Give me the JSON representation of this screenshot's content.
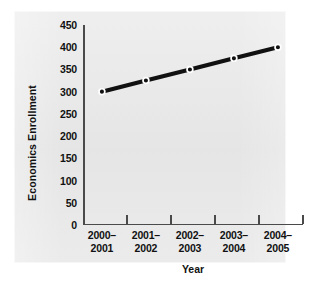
{
  "chart_data": {
    "type": "line",
    "title": "",
    "xlabel": "Year",
    "ylabel": "Economics Enrollment",
    "categories": [
      "2000–2001",
      "2001–2002",
      "2002–2003",
      "2003–2004",
      "2004–2005"
    ],
    "category_lines": [
      [
        "2000–",
        "2001"
      ],
      [
        "2001–",
        "2002"
      ],
      [
        "2002–",
        "2003"
      ],
      [
        "2003–",
        "2004"
      ],
      [
        "2004–",
        "2005"
      ]
    ],
    "values": [
      300,
      325,
      350,
      375,
      400
    ],
    "series": [
      {
        "name": "Economics Enrollment",
        "values": [
          300,
          325,
          350,
          375,
          400
        ]
      }
    ],
    "ylim": [
      0,
      450
    ],
    "ytick_values": [
      0,
      50,
      100,
      150,
      200,
      250,
      300,
      350,
      400,
      450
    ],
    "ytick_labels": [
      "0",
      "50",
      "100",
      "150",
      "200",
      "250",
      "300",
      "350",
      "400",
      "450"
    ],
    "grid": false,
    "legend": false,
    "legend_position": "none",
    "marker": "circle",
    "line_color": "#111111",
    "marker_face_color": "#ffffff",
    "marker_edge_color": "#111111",
    "panel_color": "#e9e9e9",
    "axis_color": "#4a4a4a",
    "text_color": "#111111"
  }
}
